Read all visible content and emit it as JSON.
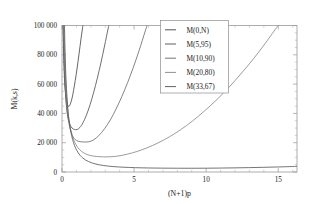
{
  "chart_data": {
    "type": "line",
    "title": "",
    "xlabel": "(N+1)p",
    "ylabel": "M(k,s)",
    "xlim": [
      0,
      16.3
    ],
    "ylim": [
      0,
      100000
    ],
    "grid": false,
    "legend_position": "top-right",
    "xticks": [
      0,
      5,
      10,
      15
    ],
    "xtick_labels": [
      "0",
      "5",
      "10",
      "15"
    ],
    "yticks": [
      0,
      20000,
      40000,
      60000,
      80000,
      100000
    ],
    "ytick_labels": [
      "0",
      "20 000",
      "40 000",
      "60 000",
      "80 000",
      "100 000"
    ],
    "series": [
      {
        "name": "M(0,N)",
        "color": "#4a4a4a",
        "minimum": {
          "x": 0.45,
          "y": 44500
        },
        "points": [
          [
            0.07,
            100000
          ],
          [
            0.1,
            88000
          ],
          [
            0.14,
            72000
          ],
          [
            0.18,
            63000
          ],
          [
            0.22,
            57000
          ],
          [
            0.27,
            52000
          ],
          [
            0.32,
            48500
          ],
          [
            0.38,
            46200
          ],
          [
            0.45,
            44800
          ],
          [
            0.52,
            45200
          ],
          [
            0.6,
            47000
          ],
          [
            0.7,
            50500
          ],
          [
            0.8,
            55500
          ],
          [
            0.92,
            62500
          ],
          [
            1.05,
            71000
          ],
          [
            1.18,
            80500
          ],
          [
            1.32,
            91000
          ],
          [
            1.45,
            100000
          ]
        ]
      },
      {
        "name": "M(5,95)",
        "color": "#555555",
        "minimum": {
          "x": 1.05,
          "y": 29000
        },
        "points": [
          [
            0.09,
            100000
          ],
          [
            0.13,
            83000
          ],
          [
            0.18,
            66000
          ],
          [
            0.24,
            54000
          ],
          [
            0.32,
            44000
          ],
          [
            0.42,
            37000
          ],
          [
            0.55,
            32500
          ],
          [
            0.7,
            30000
          ],
          [
            0.85,
            29100
          ],
          [
            1.05,
            29000
          ],
          [
            1.25,
            30500
          ],
          [
            1.45,
            33500
          ],
          [
            1.7,
            39000
          ],
          [
            1.95,
            46000
          ],
          [
            2.2,
            54500
          ],
          [
            2.45,
            64000
          ],
          [
            2.7,
            74500
          ],
          [
            2.95,
            86000
          ],
          [
            3.18,
            97000
          ],
          [
            3.25,
            100000
          ]
        ]
      },
      {
        "name": "M(10,90)",
        "color": "#6e6e6e",
        "minimum": {
          "x": 1.85,
          "y": 20500
        },
        "points": [
          [
            0.1,
            100000
          ],
          [
            0.15,
            80000
          ],
          [
            0.22,
            60000
          ],
          [
            0.32,
            45000
          ],
          [
            0.45,
            35000
          ],
          [
            0.62,
            27500
          ],
          [
            0.8,
            23500
          ],
          [
            1.0,
            21600
          ],
          [
            1.25,
            20700
          ],
          [
            1.55,
            20500
          ],
          [
            1.85,
            20600
          ],
          [
            2.2,
            22000
          ],
          [
            2.55,
            24800
          ],
          [
            2.95,
            29500
          ],
          [
            3.35,
            35500
          ],
          [
            3.75,
            43000
          ],
          [
            4.15,
            51500
          ],
          [
            4.55,
            61000
          ],
          [
            4.95,
            71500
          ],
          [
            5.35,
            83000
          ],
          [
            5.75,
            95500
          ],
          [
            5.9,
            100000
          ]
        ]
      },
      {
        "name": "M(20,80)",
        "color": "#8a8a8a",
        "minimum": {
          "x": 3.3,
          "y": 10300
        },
        "points": [
          [
            0.13,
            100000
          ],
          [
            0.2,
            76000
          ],
          [
            0.3,
            54000
          ],
          [
            0.45,
            38000
          ],
          [
            0.65,
            27000
          ],
          [
            0.9,
            20000
          ],
          [
            1.2,
            15500
          ],
          [
            1.55,
            12800
          ],
          [
            1.95,
            11300
          ],
          [
            2.4,
            10600
          ],
          [
            2.9,
            10300
          ],
          [
            3.4,
            10400
          ],
          [
            3.95,
            11000
          ],
          [
            4.55,
            12200
          ],
          [
            5.2,
            14000
          ],
          [
            5.9,
            16500
          ],
          [
            6.65,
            19800
          ],
          [
            7.45,
            24000
          ],
          [
            8.25,
            29000
          ],
          [
            9.05,
            34800
          ],
          [
            9.9,
            41800
          ],
          [
            10.75,
            49500
          ],
          [
            11.6,
            58000
          ],
          [
            12.45,
            67500
          ],
          [
            13.3,
            77500
          ],
          [
            14.15,
            88500
          ],
          [
            14.95,
            99500
          ],
          [
            15.05,
            100000
          ]
        ]
      },
      {
        "name": "M(33,67)",
        "color": "#5c5c5c",
        "minimum": {
          "x": 9.0,
          "y": 2600
        },
        "points": [
          [
            0.17,
            100000
          ],
          [
            0.25,
            70000
          ],
          [
            0.38,
            46000
          ],
          [
            0.55,
            31000
          ],
          [
            0.8,
            20000
          ],
          [
            1.1,
            13500
          ],
          [
            1.45,
            9500
          ],
          [
            1.85,
            7100
          ],
          [
            2.35,
            5400
          ],
          [
            2.9,
            4400
          ],
          [
            3.55,
            3700
          ],
          [
            4.3,
            3250
          ],
          [
            5.1,
            2950
          ],
          [
            6.0,
            2750
          ],
          [
            7.0,
            2630
          ],
          [
            8.0,
            2570
          ],
          [
            9.0,
            2560
          ],
          [
            10.0,
            2600
          ],
          [
            11.0,
            2690
          ],
          [
            12.0,
            2820
          ],
          [
            13.0,
            2990
          ],
          [
            14.0,
            3200
          ],
          [
            15.0,
            3450
          ],
          [
            16.0,
            3740
          ],
          [
            16.3,
            3840
          ]
        ]
      }
    ]
  },
  "legend": {
    "entries": [
      "M(0,N)",
      "M(5,95)",
      "M(10,90)",
      "M(20,80)",
      "M(33,67)"
    ]
  }
}
